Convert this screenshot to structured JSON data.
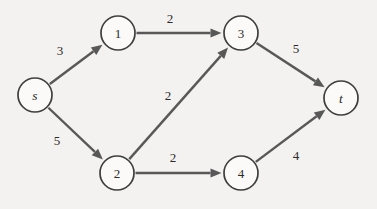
{
  "figure": {
    "kind": "directed-weighted-graph",
    "background_color": "#f3f2f0",
    "node_fill": "#fbfaf8",
    "node_stroke": "#3e3e3e",
    "edge_color": "#585858",
    "text_color": "#2b2b2b"
  },
  "nodes": [
    {
      "id": "s",
      "label": "s",
      "italic": true,
      "x": 35,
      "y": 95,
      "r": 17
    },
    {
      "id": "1",
      "label": "1",
      "italic": false,
      "x": 118,
      "y": 33,
      "r": 17
    },
    {
      "id": "2",
      "label": "2",
      "italic": false,
      "x": 117,
      "y": 173,
      "r": 17
    },
    {
      "id": "3",
      "label": "3",
      "italic": false,
      "x": 241,
      "y": 33,
      "r": 17
    },
    {
      "id": "4",
      "label": "4",
      "italic": false,
      "x": 241,
      "y": 173,
      "r": 17
    },
    {
      "id": "t",
      "label": "t",
      "italic": true,
      "x": 341,
      "y": 98,
      "r": 17
    }
  ],
  "edges": [
    {
      "from": "s",
      "to": "1",
      "weight": "3",
      "label_x": 60,
      "label_y": 50
    },
    {
      "from": "s",
      "to": "2",
      "weight": "5",
      "label_x": 57,
      "label_y": 140
    },
    {
      "from": "1",
      "to": "3",
      "weight": "2",
      "label_x": 170,
      "label_y": 18
    },
    {
      "from": "2",
      "to": "3",
      "weight": "2",
      "label_x": 168,
      "label_y": 95
    },
    {
      "from": "2",
      "to": "4",
      "weight": "2",
      "label_x": 173,
      "label_y": 157
    },
    {
      "from": "3",
      "to": "t",
      "weight": "5",
      "label_x": 296,
      "label_y": 48
    },
    {
      "from": "4",
      "to": "t",
      "weight": "4",
      "label_x": 296,
      "label_y": 155
    }
  ]
}
